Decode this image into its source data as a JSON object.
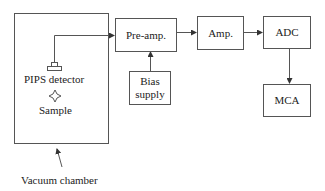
{
  "diagram": {
    "chamber": {
      "label": "Vacuum chamber"
    },
    "detector": {
      "label": "PIPS detector"
    },
    "sample": {
      "label": "Sample"
    },
    "blocks": {
      "preamp": {
        "label": "Pre-amp."
      },
      "bias": {
        "label_line1": "Bias",
        "label_line2": "supply"
      },
      "amp": {
        "label": "Amp."
      },
      "adc": {
        "label": "ADC"
      },
      "mca": {
        "label": "MCA"
      }
    },
    "connections": [
      {
        "from": "detector",
        "to": "preamp"
      },
      {
        "from": "bias",
        "to": "preamp"
      },
      {
        "from": "preamp",
        "to": "amp"
      },
      {
        "from": "amp",
        "to": "adc"
      },
      {
        "from": "adc",
        "to": "mca"
      }
    ],
    "colors": {
      "line": "#555555",
      "text": "#222222",
      "background": "#ffffff"
    }
  }
}
